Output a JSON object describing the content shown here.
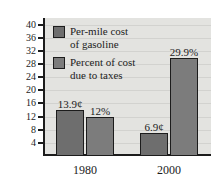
{
  "chart_data": {
    "type": "bar",
    "title": "",
    "subtitle": "",
    "xlabel": "",
    "ylabel": "",
    "categories": [
      "1980",
      "2000"
    ],
    "series": [
      {
        "name": "Per-mile cost of gasoline",
        "color": "#6e6e6e",
        "values": [
          13.9,
          6.9
        ],
        "labels": [
          "13.9¢",
          "6.9¢"
        ]
      },
      {
        "name": "Percent of cost due to taxes",
        "color": "#7c7c7c",
        "values": [
          12,
          29.9
        ],
        "labels": [
          "12%",
          "29.9%"
        ]
      }
    ],
    "ylim": [
      0,
      42
    ],
    "yticks": [
      4,
      8,
      12,
      16,
      20,
      24,
      28,
      32,
      36,
      40
    ],
    "ytick_labels": [
      "4",
      "8",
      "12",
      "16",
      "20",
      "24",
      "28",
      "32",
      "36",
      "40"
    ],
    "grid": true,
    "legend_position": "upper-left",
    "plot_background": "#e3e3e0",
    "axis_color": "#1c1c1c"
  },
  "legend": {
    "items": [
      {
        "line1": "Per-mile cost",
        "line2": "of gasoline"
      },
      {
        "line1": "Percent of cost",
        "line2": "due to taxes"
      }
    ]
  }
}
